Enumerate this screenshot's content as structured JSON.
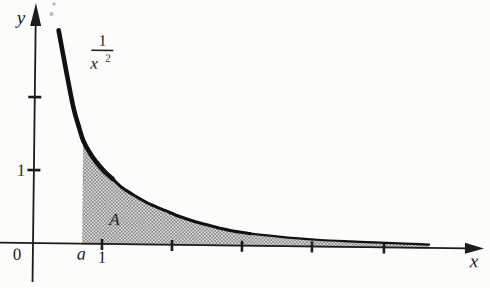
{
  "figure": {
    "labels": {
      "y_axis": "y",
      "x_axis": "x",
      "origin": "0",
      "y_tick_1": "1",
      "x_tick_1": "1",
      "lower_bound": "a",
      "region": "A",
      "fraction_numerator": "1",
      "fraction_denominator_base": "x",
      "fraction_denominator_exponent": "2"
    },
    "colors": {
      "ink": "#1c1c1c",
      "curve": "#111111",
      "paper": "#fcfcfb",
      "stipple_bg": "#dedede",
      "stipple_dot": "#868686",
      "dotted": "#9a9a9a",
      "speck": "#bdbdbd"
    },
    "geometry": {
      "rotation_deg": 0.7,
      "rotation_center": [
        33,
        243
      ],
      "axis": {
        "x_line": {
          "x1": 0,
          "x2": 468,
          "y": 243
        },
        "y_line": {
          "x": 33,
          "y1": 282,
          "y2": 25
        },
        "x_arrow_tip": [
          484,
          243
        ],
        "x_arrow_base_x": 465,
        "x_arrow_half": 5.5,
        "y_arrow_tip": [
          33,
          3
        ],
        "y_arrow_base_y": 26,
        "y_arrow_half": 5.5,
        "stroke": 1.8
      },
      "x_ticks_px": [
        102,
        172,
        242,
        312,
        384
      ],
      "y_ticks_px": [
        97,
        170
      ],
      "tick_len": {
        "x_y1": 238.2,
        "x_y2": 249.2,
        "y_x1": 26.5,
        "y_x2": 39.5
      },
      "tick_stroke": 2.6,
      "curve_px": [
        [
          56,
          30
        ],
        [
          60,
          50
        ],
        [
          66,
          80
        ],
        [
          72,
          108
        ],
        [
          78,
          128
        ],
        [
          82,
          140
        ],
        [
          88,
          151
        ],
        [
          95,
          161
        ],
        [
          103,
          170
        ],
        [
          112,
          178
        ],
        [
          122,
          187
        ],
        [
          135,
          195
        ],
        [
          150,
          203
        ],
        [
          165,
          209
        ],
        [
          180,
          215
        ],
        [
          196,
          220
        ],
        [
          212,
          224
        ],
        [
          230,
          228
        ],
        [
          250,
          231
        ],
        [
          272,
          233
        ],
        [
          295,
          235
        ],
        [
          320,
          236.5
        ],
        [
          350,
          237.5
        ],
        [
          380,
          238.3
        ],
        [
          405,
          239
        ],
        [
          429,
          239.8
        ]
      ],
      "curve_segments": [
        {
          "from": 0,
          "to": 9,
          "width": 4.6
        },
        {
          "from": 9,
          "to": 18,
          "width": 3.1
        },
        {
          "from": 18,
          "to": 25,
          "width": 2.2
        }
      ],
      "region": {
        "left_x": 82.5,
        "top_y": 141,
        "right_x": 429,
        "bottom_y": 243.8
      },
      "specks": [
        {
          "cx": 54,
          "cy": 4,
          "r": 1.8
        },
        {
          "cx": 51.5,
          "cy": 14,
          "r": 2.1
        }
      ]
    }
  },
  "chart_data": {
    "type": "line",
    "title": "",
    "xlabel": "x",
    "ylabel": "y",
    "axis_ranges": {
      "x": [
        0,
        6.3
      ],
      "y": [
        0,
        3.3
      ]
    },
    "grid": false,
    "legend": false,
    "x_ticks": [
      1,
      2,
      3,
      4,
      5
    ],
    "x_tick_labels_shown": [
      "1"
    ],
    "extra_x_labels": [
      {
        "label": "a",
        "x": 0.7
      }
    ],
    "y_ticks": [
      1,
      2
    ],
    "y_tick_labels_shown": [
      "1"
    ],
    "series": [
      {
        "name": "1/x^2",
        "function": "y = 1/x^2",
        "x_drawn_from": 0.33,
        "x_drawn_to": 5.66,
        "points": [
          [
            0.5,
            4
          ],
          [
            0.7,
            2.04
          ],
          [
            1,
            1
          ],
          [
            2,
            0.25
          ],
          [
            3,
            0.111
          ],
          [
            4,
            0.0625
          ],
          [
            5,
            0.04
          ]
        ]
      }
    ],
    "shaded_region": {
      "label": "A",
      "from_x": "a (≈0.7)",
      "to_x": 5.66,
      "between": [
        "curve 1/x^2",
        "x-axis"
      ],
      "boundary_left": "dotted vertical line at x = a"
    },
    "annotations": [
      {
        "text": "1/x²",
        "role": "curve-label",
        "position": "upper-left beside curve"
      },
      {
        "text": "A",
        "role": "shaded-region-label"
      },
      {
        "text": "a",
        "role": "lower-integration-bound"
      },
      {
        "text": "0",
        "role": "origin-label"
      }
    ]
  }
}
